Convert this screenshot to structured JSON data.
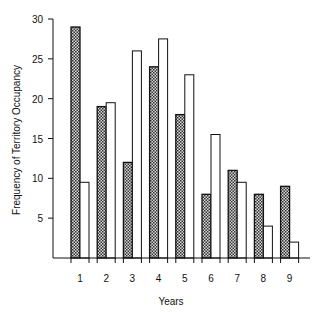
{
  "chart_data": {
    "type": "bar",
    "title": "",
    "xlabel": "Years",
    "ylabel": "Frequency of Territory Occupancy",
    "categories": [
      "1",
      "2",
      "3",
      "4",
      "5",
      "6",
      "7",
      "8",
      "9"
    ],
    "series": [
      {
        "name": "Series A (shaded)",
        "pattern": "crosshatch",
        "color": "#555555",
        "values": [
          29,
          19,
          12,
          24,
          18,
          8,
          11,
          8,
          9
        ]
      },
      {
        "name": "Series B (open)",
        "pattern": "none",
        "color": "#ffffff",
        "values": [
          9.5,
          19.5,
          26,
          27.5,
          23,
          15.5,
          9.5,
          4,
          2
        ]
      }
    ],
    "yticks": [
      5,
      10,
      15,
      20,
      25,
      30
    ],
    "ylim": [
      0,
      30
    ],
    "grid": false,
    "legend": "none"
  }
}
